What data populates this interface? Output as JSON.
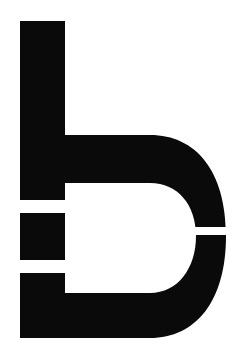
{
  "artwork": {
    "title": "Lowercase letter b",
    "subject": "letterform-b",
    "alt_text": "Bold geometric lowercase letter b",
    "style": "solid silhouette with horizontal white slits"
  },
  "canvas": {
    "width": 243,
    "height": 356,
    "background_color": "#ffffff"
  },
  "glyph": {
    "character": "b",
    "fill_color": "#0a0a0a",
    "stem": {
      "x_left": 20,
      "x_right": 65,
      "y_top": 21,
      "y_bottom": 338
    },
    "bowl": {
      "x_inner_left": 65,
      "x_outer_right": 226,
      "arm_top_y_top": 135,
      "arm_top_y_bottom": 183,
      "arm_bottom_y_top": 293,
      "arm_bottom_y_bottom": 338,
      "counter_right_x": 178,
      "counter_y_top": 183,
      "counter_y_bottom": 293
    },
    "slits": [
      {
        "name": "stem-slit-upper",
        "x": 20,
        "y": 200,
        "width": 45,
        "height": 13
      },
      {
        "name": "stem-slit-lower",
        "x": 20,
        "y": 260,
        "width": 45,
        "height": 13
      },
      {
        "name": "bowl-slit-right",
        "x": 160,
        "y": 227,
        "width": 83,
        "height": 8
      }
    ],
    "path_outer": "M20,21 L65,21 L65,135 L150,135 C196,135 226,171 226,236 C226,301 196,338 150,338 L20,338 Z",
    "path_counter": "M65,183 L150,183 C178,183 196,205 196,236 C196,268 178,293 150,293 L65,293 Z"
  }
}
